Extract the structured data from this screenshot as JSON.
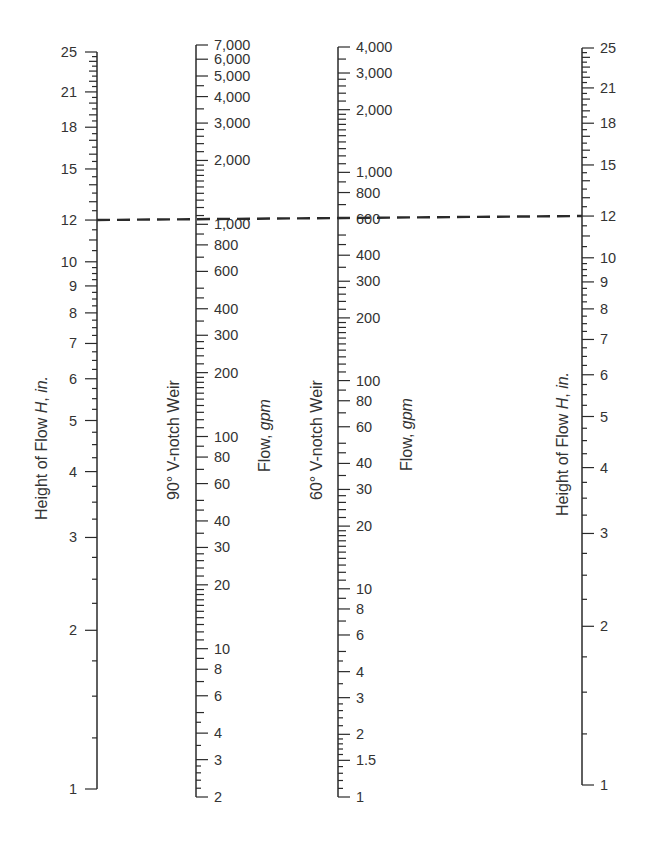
{
  "chart_data": {
    "type": "nomograph",
    "title": "",
    "axes": [
      {
        "id": "height-left",
        "title": "Height of Flow H, in.",
        "title_parts": [
          "Height of Flow ",
          "H",
          ", ",
          "in."
        ],
        "scale": "log",
        "range": [
          1,
          25
        ],
        "tick_labels": [
          "25",
          "21",
          "18",
          "15",
          "12",
          "10",
          "9",
          "8",
          "7",
          "6",
          "5",
          "4",
          "3",
          "2",
          "1"
        ],
        "label_side": "left"
      },
      {
        "id": "flow-90",
        "title": "90° V-notch Weir",
        "unit_title": "Flow, gpm",
        "unit_parts": [
          "Flow, ",
          "gpm"
        ],
        "scale": "log",
        "range": [
          2,
          7000
        ],
        "tick_labels": [
          "7,000",
          "6,000",
          "5,000",
          "4,000",
          "3,000",
          "2,000",
          "1,000",
          "800",
          "600",
          "400",
          "300",
          "200",
          "100",
          "80",
          "60",
          "40",
          "30",
          "20",
          "10",
          "8",
          "6",
          "4",
          "3",
          "2"
        ],
        "label_side": "right"
      },
      {
        "id": "flow-60",
        "title": "60° V-notch Weir",
        "unit_title": "Flow, gpm",
        "unit_parts": [
          "Flow, ",
          "gpm"
        ],
        "scale": "log",
        "range": [
          1,
          4000
        ],
        "tick_labels": [
          "4,000",
          "3,000",
          "2,000",
          "1,000",
          "800",
          "600",
          "400",
          "300",
          "200",
          "100",
          "80",
          "60",
          "40",
          "30",
          "20",
          "10",
          "8",
          "6",
          "4",
          "3",
          "2",
          "1.5",
          "1"
        ],
        "label_side": "right"
      },
      {
        "id": "height-right",
        "title": "Height of Flow H, in.",
        "title_parts": [
          "Height of Flow ",
          "H",
          ", ",
          "in."
        ],
        "scale": "log",
        "range": [
          1,
          25
        ],
        "tick_labels": [
          "25",
          "21",
          "18",
          "15",
          "12",
          "10",
          "9",
          "8",
          "7",
          "6",
          "5",
          "4",
          "3",
          "2",
          "1"
        ],
        "label_side": "right"
      }
    ],
    "example_isopleth": {
      "style": "dashed",
      "height_in": 12,
      "flow_90_gpm": 1100,
      "flow_60_gpm": 640
    },
    "grid": false,
    "legend": null
  },
  "labels": {
    "left_axis_title": "Height of Flow ",
    "left_axis_title_italic": "H",
    "left_axis_title_sep": ", ",
    "left_axis_title_unit": "in.",
    "axis90_title": "90° V-notch Weir",
    "axis90_unit": "Flow, ",
    "axis90_unit_italic": "gpm",
    "axis60_title": "60° V-notch Weir",
    "axis60_unit": "Flow, ",
    "axis60_unit_italic": "gpm",
    "right_axis_title": "Height of Flow ",
    "right_axis_title_italic": "H",
    "right_axis_title_sep": ", ",
    "right_axis_title_unit": "in."
  },
  "colors": {
    "ink": "#2a2a2a",
    "background": "#ffffff"
  }
}
